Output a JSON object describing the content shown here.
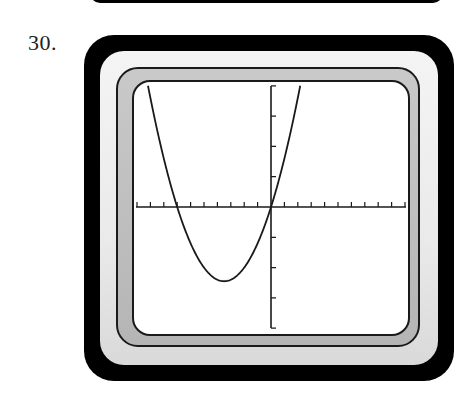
{
  "problem": {
    "number_label": "30."
  },
  "colors": {
    "frame": "#000000",
    "bezel": "#eaeaea",
    "band": "#c0c0c0",
    "screen": "#ffffff",
    "ink": "#1a1a1a"
  },
  "chart_data": {
    "type": "line",
    "title": "",
    "xlabel": "",
    "ylabel": "",
    "function": "y = 0.2x^2 + 1.4x",
    "xlim": [
      -10,
      10
    ],
    "ylim": [
      -4,
      4
    ],
    "xscl": 1,
    "yscl": 1,
    "grid": false,
    "legend": null,
    "key_points": {
      "x_intercepts": [
        -7,
        0
      ],
      "y_intercept": 0,
      "vertex": [
        -3.5,
        -2.45
      ]
    },
    "x": [
      -9.18,
      -9,
      -8,
      -7,
      -6,
      -5,
      -4,
      -3.5,
      -3,
      -2,
      -1,
      0,
      1,
      2,
      2.18
    ],
    "values": [
      4.0,
      3.6,
      1.6,
      0.0,
      -1.2,
      -2.0,
      -2.4,
      -2.45,
      -2.4,
      -2.0,
      -1.2,
      0.0,
      1.6,
      3.6,
      4.0
    ]
  }
}
